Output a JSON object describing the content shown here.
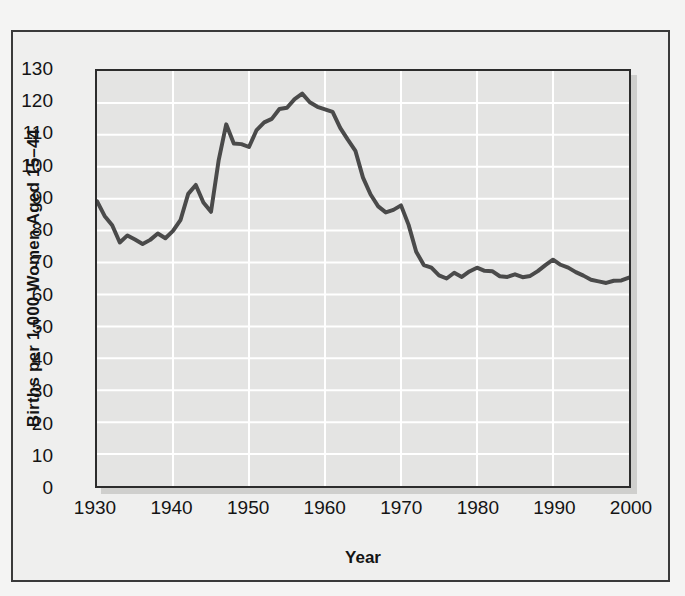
{
  "figure": {
    "axis_label_color": "#141414",
    "plot_background": "#e4e4e3",
    "gridline_color": "#ffffff",
    "line_color": "#4a4a4a",
    "frame_color": "#2c2c2c"
  },
  "chart_data": {
    "type": "line",
    "title": "",
    "xlabel": "Year",
    "ylabel": "Births per 1,000 Women Aged 15–44",
    "xlim": [
      1930,
      2000
    ],
    "ylim": [
      0,
      130
    ],
    "xticks": [
      1930,
      1940,
      1950,
      1960,
      1970,
      1980,
      1990,
      2000
    ],
    "xtick_labels": [
      "1930",
      "1940",
      "1950",
      "1960",
      "1970",
      "1980",
      "1990",
      "2000"
    ],
    "yticks": [
      0,
      10,
      20,
      30,
      40,
      50,
      60,
      70,
      80,
      90,
      100,
      110,
      120,
      130
    ],
    "ytick_labels": [
      "0",
      "10",
      "20",
      "30",
      "40",
      "50",
      "60",
      "70",
      "80",
      "90",
      "100",
      "110",
      "120",
      "130"
    ],
    "grid": "horizontal-and-vertical",
    "legend": "none",
    "series": [
      {
        "name": "General fertility rate",
        "x": [
          1930,
          1931,
          1932,
          1933,
          1934,
          1935,
          1936,
          1937,
          1938,
          1939,
          1940,
          1941,
          1942,
          1943,
          1944,
          1945,
          1946,
          1947,
          1948,
          1949,
          1950,
          1951,
          1952,
          1953,
          1954,
          1955,
          1956,
          1957,
          1958,
          1959,
          1960,
          1961,
          1962,
          1963,
          1964,
          1965,
          1966,
          1967,
          1968,
          1969,
          1970,
          1971,
          1972,
          1973,
          1974,
          1975,
          1976,
          1977,
          1978,
          1979,
          1980,
          1981,
          1982,
          1983,
          1984,
          1985,
          1986,
          1987,
          1988,
          1989,
          1990,
          1991,
          1992,
          1993,
          1994,
          1995,
          1996,
          1997,
          1998,
          1999,
          2000
        ],
        "y": [
          89.2,
          84.6,
          81.7,
          76.3,
          78.5,
          77.2,
          75.8,
          77.1,
          79.1,
          77.6,
          79.9,
          83.4,
          91.5,
          94.3,
          88.8,
          85.9,
          101.9,
          113.3,
          107.3,
          107.1,
          106.2,
          111.5,
          113.9,
          115.0,
          118.1,
          118.5,
          121.2,
          122.9,
          120.2,
          118.8,
          118.0,
          117.2,
          112.2,
          108.5,
          105.0,
          96.6,
          91.3,
          87.6,
          85.7,
          86.5,
          87.9,
          81.8,
          73.4,
          69.2,
          68.4,
          66.0,
          65.0,
          66.8,
          65.5,
          67.2,
          68.4,
          67.4,
          67.3,
          65.7,
          65.5,
          66.3,
          65.4,
          65.8,
          67.3,
          69.2,
          70.9,
          69.3,
          68.4,
          67.0,
          65.9,
          64.6,
          64.1,
          63.6,
          64.3,
          64.4,
          65.3
        ]
      }
    ]
  },
  "ytick_labels": [
    "130",
    "120",
    "110",
    "100",
    "90",
    "80",
    "70",
    "60",
    "50",
    "40",
    "30",
    "20",
    "10",
    "0"
  ],
  "xtick_labels": [
    "1930",
    "1940",
    "1950",
    "1960",
    "1970",
    "1980",
    "1990",
    "2000"
  ],
  "labels": {
    "x_axis_title": "Year",
    "y_axis_title": "Births per 1,000 Women Aged 15–44"
  }
}
